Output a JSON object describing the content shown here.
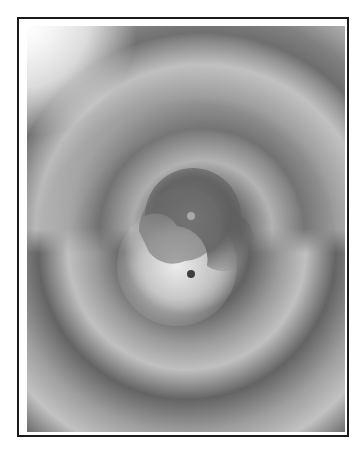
{
  "figure": {
    "colors": {
      "frame": "#1a1a1a",
      "background": "#ffffff",
      "band_dark": "#5e5e5e",
      "band_light": "#c4c4c4",
      "center_light": "#e8e8e8",
      "dot_light": "#a9a9a9",
      "dot_dark": "#3f3f3f"
    }
  }
}
